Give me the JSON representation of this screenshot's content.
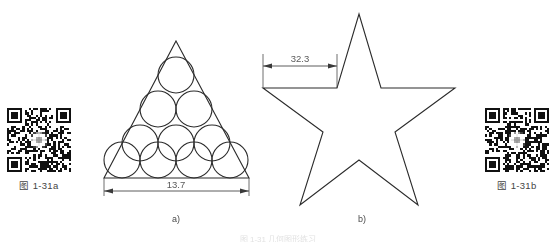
{
  "page": {
    "background_color": "#ffffff",
    "line_color": "#2b2b2b",
    "dim_color": "#5a5a5a",
    "bottom_strip_text": "图 1-31  几何图形练习"
  },
  "qr_codes": [
    {
      "id": "qr-a",
      "caption": "图 1-31a",
      "position": "left",
      "seed": 1731,
      "modules": 29
    },
    {
      "id": "qr-b",
      "caption": "图 1-31b",
      "position": "right",
      "seed": 9317,
      "modules": 29
    }
  ],
  "figures": [
    {
      "id": "figure-a",
      "caption": "a)",
      "shape": "triangle-with-packed-circles",
      "circle_count": 10,
      "circle_rows": [
        1,
        2,
        3,
        4
      ],
      "circle_radius_px": 18,
      "dimension": {
        "label": "13.7",
        "value": 13.7,
        "orientation": "horizontal",
        "measures": "triangle-base-width"
      }
    },
    {
      "id": "figure-b",
      "caption": "b)",
      "shape": "five-pointed-star",
      "points": 5,
      "dimension": {
        "label": "32.3",
        "value": 32.3,
        "orientation": "horizontal",
        "measures": "left-upper-inner-vertex-to-top-point-offset"
      }
    }
  ]
}
